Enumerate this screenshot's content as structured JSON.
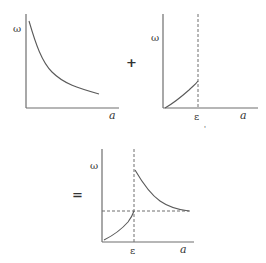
{
  "diagram": {
    "graph1": {
      "y_label": "ω",
      "x_label": "a",
      "description": "decreasing curve"
    },
    "operator_plus": "+",
    "graph2": {
      "y_label": "ω",
      "x_label": "a",
      "threshold_label": "ε",
      "description": "increasing curve up to threshold ε"
    },
    "operator_equals": "=",
    "graph3": {
      "y_label": "ω",
      "x_label": "a",
      "threshold_label": "ε",
      "description": "rising curve to ε, jump, then decaying curve approaching asymptote"
    },
    "stray_mark": "'"
  }
}
